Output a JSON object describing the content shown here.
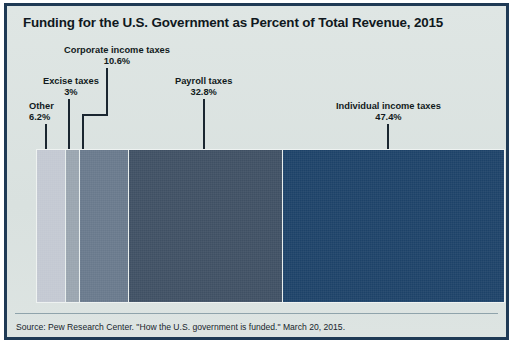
{
  "chart_data": {
    "type": "bar",
    "orientation": "horizontal-stacked",
    "title": "Funding for the U.S. Government as Percent of Total Revenue, 2015",
    "xlabel": "",
    "ylabel": "",
    "categories": [
      "Other",
      "Excise taxes",
      "Corporate income taxes",
      "Payroll taxes",
      "Individual income taxes"
    ],
    "values": [
      6.2,
      3.0,
      10.6,
      32.8,
      47.4
    ],
    "value_labels": [
      "6.2%",
      "3%",
      "10.6%",
      "32.8%",
      "47.4%"
    ],
    "colors": [
      "#c3c8d2",
      "#9aa5af",
      "#69798c",
      "#3f5063",
      "#1d4268"
    ],
    "xlim": [
      0,
      100
    ],
    "grid": false,
    "legend": "none",
    "annotations": [
      "Source: Pew Research Center. \"How the U.S. government is funded.\" March 20, 2015."
    ]
  },
  "title": "Funding for the U.S. Government as Percent of Total Revenue, 2015",
  "segments": [
    {
      "name": "Other",
      "pct_label": "6.2%",
      "value": 6.2,
      "color": "#c3c8d2"
    },
    {
      "name": "Excise taxes",
      "pct_label": "3%",
      "value": 3.0,
      "color": "#9aa5af"
    },
    {
      "name": "Corporate income taxes",
      "pct_label": "10.6%",
      "value": 10.6,
      "color": "#69798c"
    },
    {
      "name": "Payroll taxes",
      "pct_label": "32.8%",
      "value": 32.8,
      "color": "#3f5063"
    },
    {
      "name": "Individual income taxes",
      "pct_label": "47.4%",
      "value": 47.4,
      "color": "#1d4268"
    }
  ],
  "footer": {
    "source": "Source: Pew Research Center. \"How the U.S. government is funded.\" March 20, 2015."
  },
  "theme": {
    "frame_border": "#1f3a55",
    "background": "#dde4e2",
    "text": "#101820",
    "leader_line": "#1a2630",
    "rule": "#8fa3ab"
  }
}
